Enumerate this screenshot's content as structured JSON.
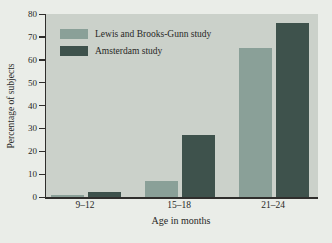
{
  "figure": {
    "kind": "grouped-bar-chart",
    "background_color": "#eaede8",
    "plot_background_color": "#cbd1ca",
    "axis_color": "#2f2e2c",
    "text_color": "#282826"
  },
  "chart_data": {
    "type": "bar",
    "title": "",
    "xlabel": "Age in months",
    "ylabel": "Percentage of subjects",
    "categories": [
      "9–12",
      "15–18",
      "21–24"
    ],
    "series": [
      {
        "name": "Lewis and Brooks-Gunn study",
        "values": [
          1,
          7,
          65
        ],
        "color": "#8aa098"
      },
      {
        "name": "Amsterdam study",
        "values": [
          2,
          27,
          76
        ],
        "color": "#3e524c"
      }
    ],
    "ylim": [
      0,
      80
    ],
    "ytick_step": 10,
    "ytick_labels": [
      "0",
      "10",
      "20",
      "30",
      "40",
      "50",
      "60",
      "70",
      "80"
    ],
    "grid": false,
    "legend_position": "top-left"
  }
}
